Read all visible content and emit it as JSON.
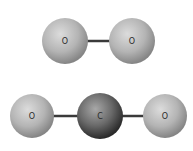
{
  "molecules": [
    {
      "name": "oxygen",
      "atoms": [
        {
          "symbol": "O",
          "cx": 65,
          "cy": 41,
          "r": 23,
          "type": "oxygen"
        },
        {
          "symbol": "O",
          "cx": 132,
          "cy": 41,
          "r": 23,
          "type": "oxygen"
        }
      ],
      "bonds": [
        {
          "x1": 87,
          "x2": 110,
          "y": 41
        }
      ]
    },
    {
      "name": "carbon-dioxide",
      "atoms": [
        {
          "symbol": "O",
          "cx": 32,
          "cy": 116,
          "r": 22,
          "type": "oxygen"
        },
        {
          "symbol": "C",
          "cx": 100,
          "cy": 116,
          "r": 23,
          "type": "carbon"
        },
        {
          "symbol": "O",
          "cx": 165,
          "cy": 116,
          "r": 22,
          "type": "oxygen"
        }
      ],
      "bonds": [
        {
          "x1": 53,
          "x2": 78,
          "y": 116
        },
        {
          "x1": 122,
          "x2": 144,
          "y": 116
        }
      ]
    }
  ],
  "colors": {
    "oxygen_light": "#d8d8d8",
    "oxygen_dark": "#8a8a8a",
    "carbon_light": "#a0a0a0",
    "carbon_dark": "#2e2e2e",
    "bond": "#3a3a3a"
  }
}
